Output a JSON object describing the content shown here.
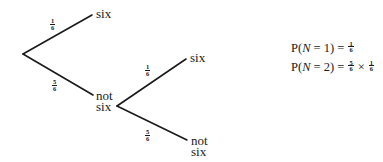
{
  "tree": {
    "root": {
      "x": 23,
      "y": 54
    },
    "level1": {
      "upper_branch": {
        "probability": {
          "num": "1",
          "den": "6"
        },
        "outcome_label": "six",
        "end": {
          "x": 92,
          "y": 15
        }
      },
      "lower_branch": {
        "probability": {
          "num": "5",
          "den": "6"
        },
        "outcome_label_line1": "not",
        "outcome_label_line2": "six",
        "end": {
          "x": 93,
          "y": 95
        }
      }
    },
    "level2": {
      "node": {
        "x": 117,
        "y": 106
      },
      "upper_branch": {
        "probability": {
          "num": "1",
          "den": "6"
        },
        "outcome_label": "six",
        "end": {
          "x": 186,
          "y": 59
        }
      },
      "lower_branch": {
        "probability": {
          "num": "5",
          "den": "6"
        },
        "outcome_label_line1": "not",
        "outcome_label_line2": "six",
        "end": {
          "x": 187,
          "y": 140
        }
      }
    },
    "line_color": "#1a1a1a"
  },
  "formulas": {
    "f1": {
      "prefix": "P(",
      "variable": "N",
      "equals_value": " = 1) = ",
      "frac1": {
        "num": "1",
        "den": "6"
      }
    },
    "f2": {
      "prefix": "P(",
      "variable": "N",
      "equals_value": " = 2) = ",
      "frac1": {
        "num": "5",
        "den": "6"
      },
      "operator": "×",
      "frac2": {
        "num": "1",
        "den": "6"
      }
    }
  }
}
